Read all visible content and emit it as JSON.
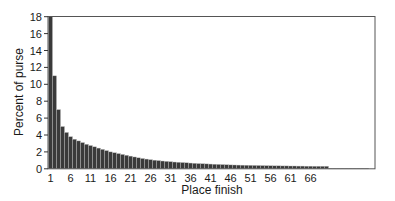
{
  "chart_data": {
    "type": "bar",
    "title": "",
    "xlabel": "Place finish",
    "ylabel": "Percent of purse",
    "ylim": [
      0,
      18
    ],
    "yticks": [
      0,
      2,
      4,
      6,
      8,
      10,
      12,
      14,
      16,
      18
    ],
    "xticks": [
      1,
      6,
      11,
      16,
      21,
      26,
      31,
      36,
      41,
      46,
      51,
      56,
      61,
      66
    ],
    "grid": false,
    "legend": null,
    "bar_color": "#3a3a3a",
    "categories": [
      1,
      2,
      3,
      4,
      5,
      6,
      7,
      8,
      9,
      10,
      11,
      12,
      13,
      14,
      15,
      16,
      17,
      18,
      19,
      20,
      21,
      22,
      23,
      24,
      25,
      26,
      27,
      28,
      29,
      30,
      31,
      32,
      33,
      34,
      35,
      36,
      37,
      38,
      39,
      40,
      41,
      42,
      43,
      44,
      45,
      46,
      47,
      48,
      49,
      50,
      51,
      52,
      53,
      54,
      55,
      56,
      57,
      58,
      59,
      60,
      61,
      62,
      63,
      64,
      65,
      66,
      67,
      68,
      69,
      70,
      71,
      72,
      73,
      74,
      75,
      76,
      77,
      78,
      79,
      80
    ],
    "values": [
      18.0,
      11.0,
      7.0,
      5.0,
      4.3,
      3.8,
      3.5,
      3.3,
      3.1,
      2.9,
      2.75,
      2.6,
      2.45,
      2.3,
      2.15,
      2.0,
      1.9,
      1.8,
      1.7,
      1.6,
      1.5,
      1.4,
      1.3,
      1.22,
      1.15,
      1.08,
      1.02,
      0.97,
      0.92,
      0.88,
      0.84,
      0.8,
      0.77,
      0.74,
      0.71,
      0.68,
      0.65,
      0.62,
      0.6,
      0.58,
      0.56,
      0.54,
      0.52,
      0.5,
      0.48,
      0.46,
      0.45,
      0.44,
      0.43,
      0.42,
      0.41,
      0.4,
      0.39,
      0.38,
      0.37,
      0.36,
      0.35,
      0.35,
      0.34,
      0.34,
      0.33,
      0.33,
      0.32,
      0.32,
      0.31,
      0.31,
      0.3,
      0.3,
      0.3,
      0.3,
      0.05,
      0.05,
      0.05,
      0.05,
      0.05,
      0.05,
      0.05,
      0.05,
      0.05,
      0.05
    ]
  }
}
